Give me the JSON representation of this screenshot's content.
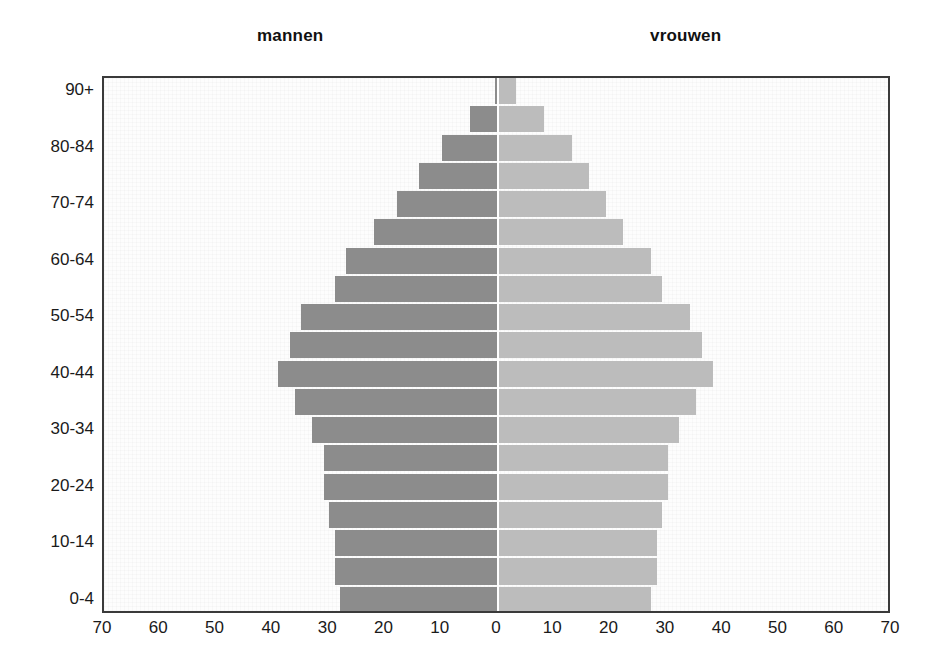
{
  "headings": {
    "male": "mannen",
    "female": "vrouwen"
  },
  "colors": {
    "male_bar": "#8c8c8c",
    "female_bar": "#bcbcbc",
    "frame": "#3a3a3a",
    "plot_background": "#fdfdfd",
    "text": "#1a1a1a"
  },
  "chart_data": {
    "type": "bar",
    "subtype": "population-pyramid",
    "title": "",
    "xlabel": "",
    "ylabel": "",
    "orientation": "horizontal",
    "grid": false,
    "legend": "top",
    "legend_entries": [
      "mannen",
      "vrouwen"
    ],
    "xlim": [
      -70,
      70
    ],
    "x_tick_labels": [
      "70",
      "60",
      "50",
      "40",
      "30",
      "20",
      "10",
      "0",
      "10",
      "20",
      "30",
      "40",
      "50",
      "60",
      "70"
    ],
    "x_tick_values": [
      -70,
      -60,
      -50,
      -40,
      -30,
      -20,
      -10,
      0,
      10,
      20,
      30,
      40,
      50,
      60,
      70
    ],
    "categories": [
      "0-4",
      "5-9",
      "10-14",
      "15-19",
      "20-24",
      "25-29",
      "30-34",
      "35-39",
      "40-44",
      "45-49",
      "50-54",
      "55-59",
      "60-64",
      "65-69",
      "70-74",
      "75-79",
      "80-84",
      "85-89",
      "90+"
    ],
    "y_tick_labels": [
      "90+",
      "80-84",
      "70-74",
      "60-64",
      "50-54",
      "40-44",
      "30-34",
      "20-24",
      "10-14",
      "0-4"
    ],
    "y_tick_categories": [
      "90+",
      "80-84",
      "70-74",
      "60-64",
      "50-54",
      "40-44",
      "30-34",
      "20-24",
      "10-14",
      "0-4"
    ],
    "series": [
      {
        "name": "mannen",
        "side": "left",
        "values": [
          28,
          29,
          29,
          30,
          31,
          31,
          33,
          36,
          39,
          37,
          35,
          29,
          27,
          22,
          18,
          14,
          10,
          5,
          0.5
        ]
      },
      {
        "name": "vrouwen",
        "side": "right",
        "values": [
          27,
          28,
          28,
          29,
          30,
          30,
          32,
          35,
          38,
          36,
          34,
          29,
          27,
          22,
          19,
          16,
          13,
          8,
          3
        ]
      }
    ]
  }
}
